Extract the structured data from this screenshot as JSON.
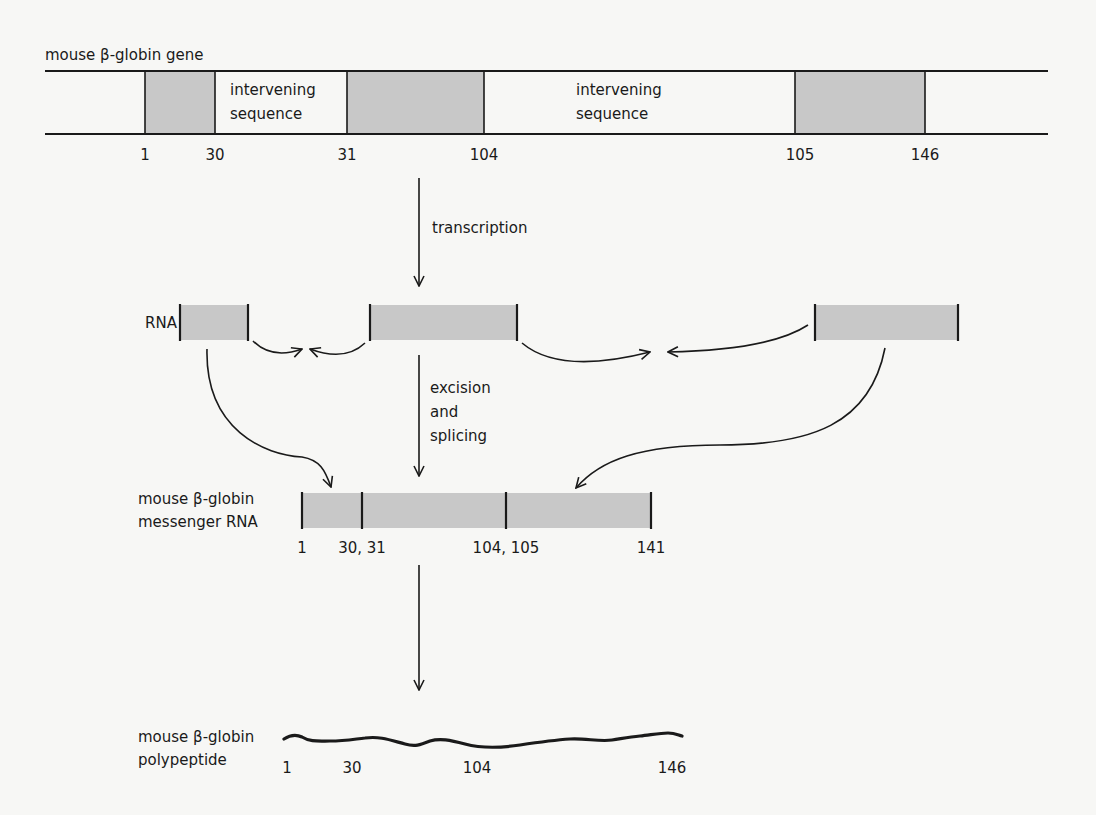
{
  "gene": {
    "title": "mouse β-globin gene",
    "intron_label_1": [
      "intervening",
      "sequence"
    ],
    "intron_label_2": [
      "intervening",
      "sequence"
    ],
    "exons": [
      {
        "start": 1,
        "end": 30
      },
      {
        "start": 31,
        "end": 104
      },
      {
        "start": 105,
        "end": 146
      }
    ],
    "positions": [
      "1",
      "30",
      "31",
      "104",
      "105",
      "146"
    ]
  },
  "steps": {
    "transcription": "transcription",
    "excision": [
      "excision",
      "and",
      "splicing"
    ]
  },
  "rna": {
    "label": "RNA"
  },
  "mrna": {
    "label": [
      "mouse β-globin",
      "messenger RNA"
    ],
    "positions": [
      "1",
      "30, 31",
      "104, 105",
      "141"
    ]
  },
  "polypeptide": {
    "label": [
      "mouse β-globin",
      "polypeptide"
    ],
    "positions": [
      "1",
      "30",
      "104",
      "146"
    ]
  },
  "colors": {
    "exon_fill": "#c8c8c8",
    "ink": "#1a1a1a",
    "background": "#f7f7f5"
  }
}
